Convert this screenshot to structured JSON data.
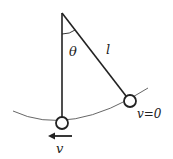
{
  "diagram": {
    "type": "pendulum",
    "labels": {
      "angle": "θ",
      "length": "l",
      "velocity_bottom": "v",
      "velocity_top": "v=0"
    },
    "colors": {
      "line": "#222222",
      "arc": "#555555",
      "background": "#ffffff"
    }
  }
}
